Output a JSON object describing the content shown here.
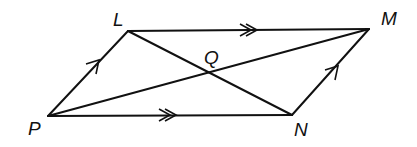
{
  "diagram": {
    "type": "parallelogram",
    "vertices": {
      "P": {
        "label": "P",
        "x": 48,
        "y": 116
      },
      "L": {
        "label": "L",
        "x": 128,
        "y": 31
      },
      "M": {
        "label": "M",
        "x": 369,
        "y": 29
      },
      "N": {
        "label": "N",
        "x": 292,
        "y": 115
      }
    },
    "intersection": {
      "label": "Q",
      "x": 210,
      "y": 71
    },
    "sides": [
      "PL",
      "LM",
      "MN",
      "NP"
    ],
    "diagonals": [
      "PM",
      "LN"
    ],
    "parallel_marks": {
      "single": [
        "PL",
        "NM"
      ],
      "double": [
        "LM",
        "PN"
      ]
    },
    "colors": {
      "line": "#111111",
      "background": "#ffffff"
    }
  }
}
